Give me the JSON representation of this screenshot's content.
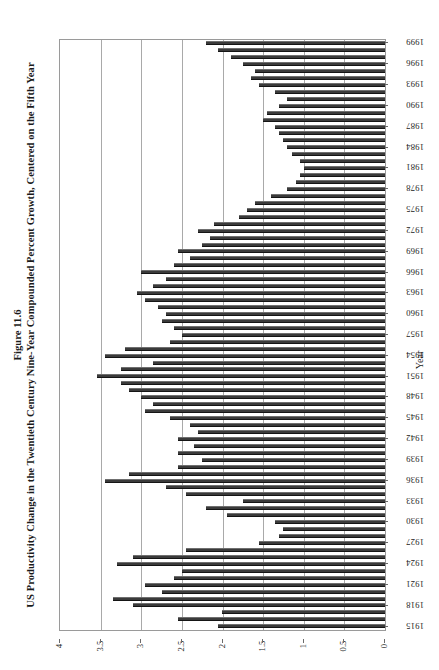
{
  "figure": {
    "number": "Figure 11.6",
    "title": "US Productivity Change in the Twentieth Century Nine-Year Compounded Percent Growth, Centered on the Fifth Year"
  },
  "axis_name_category": "Year",
  "chart_data": {
    "type": "bar",
    "orientation": "horizontal",
    "title": "US Productivity Change in the Twentieth Century Nine-Year Compounded Percent Growth, Centered on the Fifth Year",
    "subtitle": "Figure 11.6",
    "xlabel": "",
    "ylabel": "Year",
    "xlim": [
      4,
      0
    ],
    "x_axis_reversed": true,
    "xticks": [
      "4",
      "3.5",
      "3",
      "2.5",
      "2",
      "1.5",
      "1",
      "0.5",
      "0"
    ],
    "xtick_values": [
      4,
      3.5,
      3,
      2.5,
      2,
      1.5,
      1,
      0.5,
      0
    ],
    "grid": true,
    "grid_axis": "x",
    "legend": "none",
    "category_tick_labels": [
      "1999",
      "1996",
      "1993",
      "1990",
      "1987",
      "1984",
      "1981",
      "1978",
      "1975",
      "1972",
      "1969",
      "1966",
      "1963",
      "1960",
      "1957",
      "1954",
      "1951",
      "1948",
      "1945",
      "1942",
      "1939",
      "1936",
      "1933",
      "1930",
      "1927",
      "1924",
      "1921",
      "1918",
      "1915"
    ],
    "category_order_top_to_bottom": "1999 at top, 1915 at bottom",
    "bar_color": "#3a3a3a",
    "categories": [
      "1915",
      "1916",
      "1917",
      "1918",
      "1919",
      "1920",
      "1921",
      "1922",
      "1923",
      "1924",
      "1925",
      "1926",
      "1927",
      "1928",
      "1929",
      "1930",
      "1931",
      "1932",
      "1933",
      "1934",
      "1935",
      "1936",
      "1937",
      "1938",
      "1939",
      "1940",
      "1941",
      "1942",
      "1943",
      "1944",
      "1945",
      "1946",
      "1947",
      "1948",
      "1949",
      "1950",
      "1951",
      "1952",
      "1953",
      "1954",
      "1955",
      "1956",
      "1957",
      "1958",
      "1959",
      "1960",
      "1961",
      "1962",
      "1963",
      "1964",
      "1965",
      "1966",
      "1967",
      "1968",
      "1969",
      "1970",
      "1971",
      "1972",
      "1973",
      "1974",
      "1975",
      "1976",
      "1977",
      "1978",
      "1979",
      "1980",
      "1981",
      "1982",
      "1983",
      "1984",
      "1985",
      "1986",
      "1987",
      "1988",
      "1989",
      "1990",
      "1991",
      "1992",
      "1993",
      "1994",
      "1995",
      "1996",
      "1997",
      "1998",
      "1999"
    ],
    "values": [
      2.05,
      2.55,
      2.0,
      3.1,
      3.35,
      2.75,
      2.95,
      2.6,
      2.5,
      3.3,
      3.1,
      2.45,
      1.55,
      1.3,
      1.25,
      1.35,
      1.95,
      2.2,
      1.75,
      2.45,
      2.7,
      3.45,
      3.15,
      2.55,
      2.25,
      2.55,
      2.35,
      2.55,
      2.3,
      2.4,
      2.65,
      2.95,
      2.85,
      3.0,
      3.15,
      3.25,
      3.55,
      3.25,
      2.85,
      3.45,
      3.2,
      2.65,
      2.5,
      2.6,
      2.75,
      2.7,
      2.8,
      2.95,
      3.05,
      2.85,
      2.7,
      3.0,
      2.6,
      2.4,
      2.55,
      2.25,
      2.15,
      2.3,
      2.1,
      1.8,
      1.7,
      1.6,
      1.4,
      1.2,
      1.1,
      1.05,
      1.0,
      1.05,
      1.15,
      1.2,
      1.25,
      1.3,
      1.35,
      1.5,
      1.45,
      1.3,
      1.2,
      1.35,
      1.55,
      1.65,
      1.6,
      1.75,
      1.9,
      2.05,
      2.2
    ]
  }
}
